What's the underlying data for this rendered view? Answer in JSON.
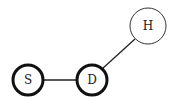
{
  "diagram": {
    "type": "graph",
    "nodes": [
      {
        "id": "S",
        "label": "S",
        "cx": 28,
        "cy": 80,
        "r": 15,
        "bold": true
      },
      {
        "id": "D",
        "label": "D",
        "cx": 92,
        "cy": 80,
        "r": 15,
        "bold": true
      },
      {
        "id": "H",
        "label": "H",
        "cx": 148,
        "cy": 26,
        "r": 18,
        "bold": false
      }
    ],
    "edges": [
      {
        "from": "S",
        "to": "D"
      },
      {
        "from": "D",
        "to": "H"
      }
    ],
    "colors": {
      "stroke": "#111111",
      "background": "#ffffff"
    }
  }
}
